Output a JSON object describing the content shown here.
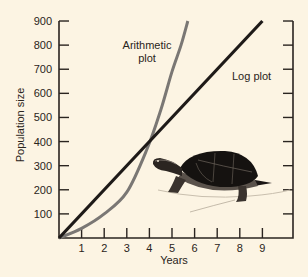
{
  "chart_data": {
    "type": "line",
    "title": "",
    "xlabel": "Years",
    "ylabel": "Population size",
    "xlim": [
      0,
      10
    ],
    "ylim": [
      0,
      900
    ],
    "x_ticks": [
      1,
      2,
      3,
      4,
      5,
      6,
      7,
      8,
      9
    ],
    "y_ticks": [
      100,
      200,
      300,
      400,
      500,
      600,
      700,
      800,
      900
    ],
    "right_axis_ticks": true,
    "grid": false,
    "legend": "inline annotations",
    "series": [
      {
        "name": "Arithmetic plot",
        "color": "#7a7774",
        "x": [
          0,
          1,
          2,
          3,
          3.9,
          4.5,
          5,
          5.4,
          5.7
        ],
        "y": [
          0,
          40,
          100,
          190,
          370,
          530,
          690,
          800,
          900
        ]
      },
      {
        "name": "Log plot",
        "color": "#1e1a18",
        "x": [
          0,
          9
        ],
        "y": [
          0,
          900
        ]
      }
    ],
    "annotations": [
      {
        "text": "Arithmetic",
        "near_series": "Arithmetic plot"
      },
      {
        "text": "plot",
        "near_series": "Arithmetic plot"
      },
      {
        "text": "Log plot",
        "near_series": "Log plot"
      }
    ],
    "illustration": "turtle"
  },
  "labels": {
    "xlabel": "Years",
    "ylabel": "Population size",
    "arith_line1": "Arithmetic",
    "arith_line2": "plot",
    "log": "Log plot"
  },
  "colors": {
    "background": "#fcf4e3",
    "axis": "#2a2420",
    "arithmetic": "#7a7774",
    "log": "#1e1a18"
  }
}
